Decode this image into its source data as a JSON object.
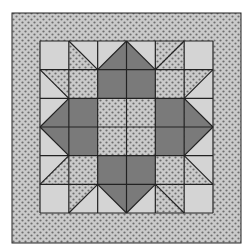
{
  "quilt": {
    "title": "Quilt block pattern",
    "colors": {
      "light": "#d4d4d4",
      "dark": "#7a7a7a",
      "dotted_bg": "#c8c8c8",
      "dot": "#6e6e6e",
      "line": "#222222",
      "background": "#ffffff"
    },
    "outer_border": {
      "x": 12,
      "y": 13,
      "w": 229,
      "h": 230,
      "fill": "dotted"
    },
    "inner_frame": {
      "x": 40,
      "y": 41,
      "w": 173,
      "h": 172
    },
    "grid": {
      "rows": 6,
      "cols": 6,
      "cells": [
        [
          "L",
          "split:tl-br:P:L",
          "split:bl-tr:L:D",
          "split:tl-br:D:L",
          "split:bl-tr:P:P",
          "L"
        ],
        [
          "split:tl-br:L:P",
          "P",
          "D",
          "D",
          "P",
          "split:bl-tr:P:L"
        ],
        [
          "split:bl-tr:L:D",
          "D",
          "P",
          "P",
          "D",
          "split:tl-br:D:L"
        ],
        [
          "split:tl-br:L:D",
          "D",
          "P",
          "P",
          "D",
          "split:bl-tr:D:L"
        ],
        [
          "split:bl-tr:L:P",
          "P",
          "D",
          "D",
          "P",
          "split:tl-br:P:L"
        ],
        [
          "L",
          "split:bl-tr:P:L",
          "split:tl-br:L:D",
          "split:bl-tr:D:L",
          "split:tl-br:P:P",
          "L"
        ]
      ]
    }
  }
}
